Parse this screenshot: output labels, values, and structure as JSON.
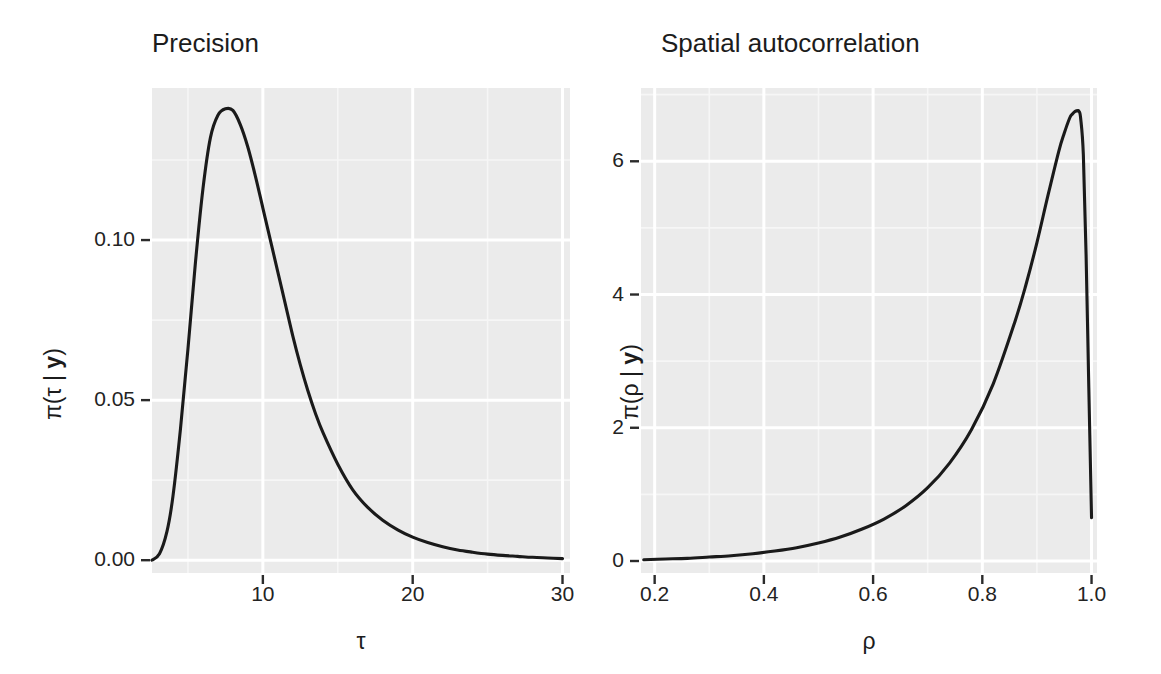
{
  "figure": {
    "width": 1161,
    "height": 674,
    "background": "#ffffff",
    "panel_fill": "#ebebeb",
    "grid_major_color": "#ffffff",
    "grid_minor_color": "#f6f6f6",
    "line_color": "#1a1a1a",
    "text_color": "#1c1c1c"
  },
  "panels": [
    {
      "id": "precision",
      "title": "Precision",
      "xlabel": "τ",
      "ylabel_prefix": "π(τ | ",
      "ylabel_bold": "y",
      "ylabel_suffix": ")",
      "xticks": [
        "10",
        "20",
        "30"
      ],
      "yticks": [
        "0.00",
        "0.05",
        "0.10"
      ]
    },
    {
      "id": "spatial-autocorrelation",
      "title": "Spatial autocorrelation",
      "xlabel": "ρ",
      "ylabel_prefix": "π(ρ | ",
      "ylabel_bold": "y",
      "ylabel_suffix": ")",
      "xticks": [
        "0.2",
        "0.4",
        "0.6",
        "0.8",
        "1.0"
      ],
      "yticks": [
        "0",
        "2",
        "4",
        "6"
      ]
    }
  ],
  "chart_data": [
    {
      "type": "line",
      "id": "precision",
      "title": "Precision",
      "xlabel": "τ",
      "ylabel": "π(τ | y)",
      "xlim": [
        2.6,
        30.5
      ],
      "ylim": [
        -0.004,
        0.1475
      ],
      "xticks": [
        10,
        20,
        30
      ],
      "yticks": [
        0.0,
        0.05,
        0.1
      ],
      "grid": true,
      "legend": "none",
      "peak": {
        "x": 7.96,
        "y": 0.141
      },
      "x": [
        2.6,
        3.1,
        3.6,
        4.0,
        4.5,
        5.0,
        5.5,
        6.0,
        6.5,
        7.0,
        7.5,
        8.0,
        8.5,
        9.0,
        9.5,
        10.0,
        10.5,
        11.0,
        11.5,
        12.0,
        12.5,
        13.0,
        13.5,
        14.0,
        15.0,
        16.0,
        17.0,
        18.0,
        19.0,
        20.0,
        21.0,
        22.0,
        23.0,
        24.0,
        25.0,
        26.0,
        27.0,
        28.0,
        29.0,
        30.0
      ],
      "y": [
        0.0,
        0.002,
        0.009,
        0.02,
        0.041,
        0.066,
        0.093,
        0.116,
        0.132,
        0.139,
        0.141,
        0.1405,
        0.136,
        0.129,
        0.12,
        0.11,
        0.1,
        0.09,
        0.08,
        0.07,
        0.061,
        0.053,
        0.046,
        0.04,
        0.03,
        0.022,
        0.0165,
        0.0125,
        0.0095,
        0.0072,
        0.0055,
        0.0042,
        0.0032,
        0.0025,
        0.0019,
        0.0015,
        0.0012,
        0.0009,
        0.0007,
        0.0005
      ]
    },
    {
      "type": "line",
      "id": "spatial-autocorrelation",
      "title": "Spatial autocorrelation",
      "xlabel": "ρ",
      "ylabel": "π(ρ | y)",
      "xlim": [
        0.175,
        1.01
      ],
      "ylim": [
        -0.18,
        7.1
      ],
      "xticks": [
        0.2,
        0.4,
        0.6,
        0.8,
        1.0
      ],
      "yticks": [
        0,
        2,
        4,
        6
      ],
      "grid": true,
      "legend": "none",
      "peak": {
        "x": 0.977,
        "y": 6.76
      },
      "endpoint": {
        "x": 1.0,
        "y": 0.65
      },
      "x": [
        0.18,
        0.22,
        0.26,
        0.3,
        0.34,
        0.38,
        0.42,
        0.46,
        0.5,
        0.54,
        0.58,
        0.62,
        0.66,
        0.7,
        0.74,
        0.78,
        0.82,
        0.86,
        0.88,
        0.9,
        0.92,
        0.94,
        0.95,
        0.96,
        0.965,
        0.97,
        0.975,
        0.977,
        0.98,
        0.985,
        0.99,
        0.995,
        1.0
      ],
      "y": [
        0.02,
        0.03,
        0.04,
        0.06,
        0.08,
        0.11,
        0.15,
        0.2,
        0.27,
        0.36,
        0.48,
        0.63,
        0.83,
        1.1,
        1.47,
        1.97,
        2.66,
        3.6,
        4.15,
        4.78,
        5.48,
        6.15,
        6.42,
        6.65,
        6.71,
        6.75,
        6.76,
        6.75,
        6.65,
        6.1,
        4.6,
        2.6,
        0.65
      ]
    }
  ]
}
